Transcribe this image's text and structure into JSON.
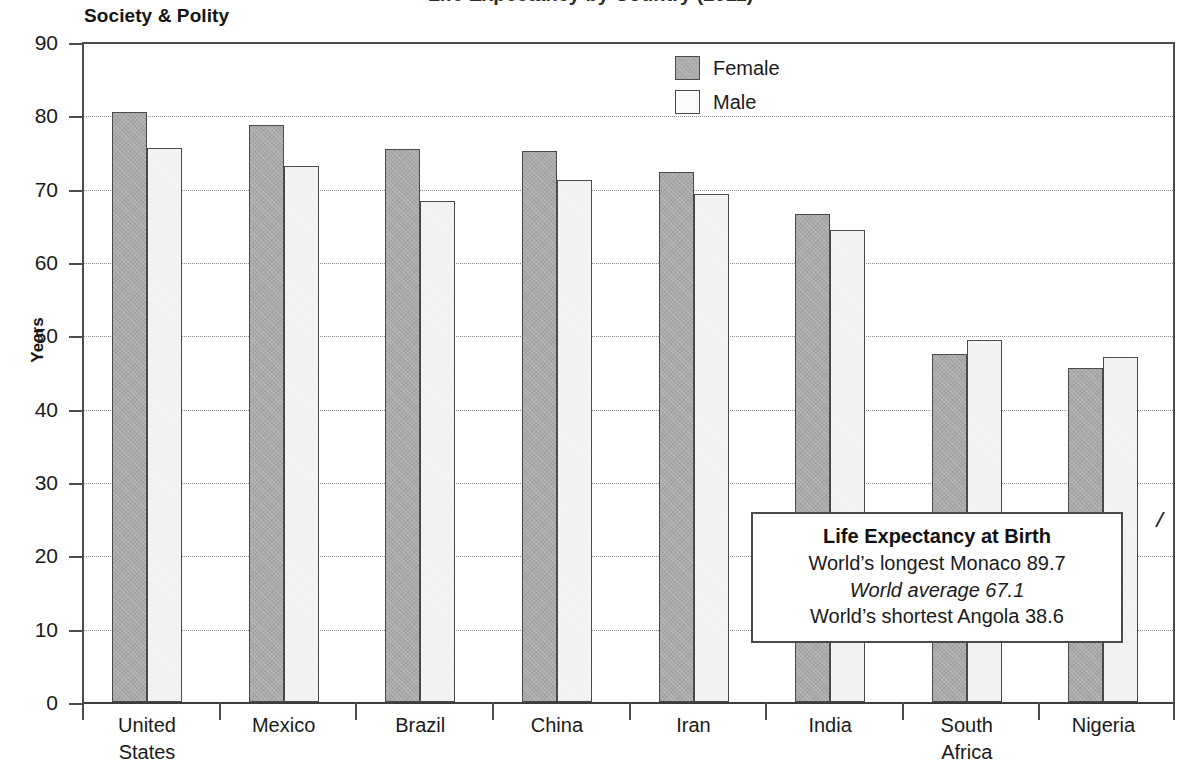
{
  "page": {
    "section_heading": "Society & Polity",
    "clipped_title": "Life Expectancy by Country (2011)"
  },
  "legend": {
    "items": [
      {
        "label": "Female",
        "key": "female",
        "color": "#a9a9a9"
      },
      {
        "label": "Male",
        "key": "male",
        "color": "#fbfbfb"
      }
    ]
  },
  "callout": {
    "title": "Life Expectancy at Birth",
    "line_longest": "World’s longest Monaco 89.7",
    "line_average": "World average 67.1",
    "line_shortest": "World’s shortest Angola 38.6"
  },
  "axes": {
    "y_title": "Years",
    "y_ticks": [
      "0",
      "10",
      "20",
      "30",
      "40",
      "50",
      "60",
      "70",
      "80",
      "90"
    ]
  },
  "chart_data": {
    "type": "bar",
    "title": "Life Expectancy by Country (2011)",
    "xlabel": "",
    "ylabel": "Years",
    "ylim": [
      0,
      90
    ],
    "ytick_step": 10,
    "grid": true,
    "legend_position": "top-center",
    "categories": [
      "United\nStates",
      "Mexico",
      "Brazil",
      "China",
      "Iran",
      "India",
      "South\nAfrica",
      "Nigeria"
    ],
    "series": [
      {
        "name": "Female",
        "color": "#a9a9a9",
        "values": [
          80.4,
          78.7,
          75.4,
          75.1,
          72.3,
          66.5,
          47.5,
          45.5
        ]
      },
      {
        "name": "Male",
        "color": "#f4f4f4",
        "values": [
          75.6,
          73.1,
          68.3,
          71.2,
          69.3,
          64.4,
          49.3,
          47.1
        ]
      }
    ],
    "annotations": [
      "Life Expectancy at Birth",
      "World’s longest Monaco 89.7",
      "World average 67.1",
      "World’s shortest Angola 38.6"
    ]
  }
}
